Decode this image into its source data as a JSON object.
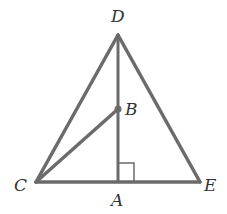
{
  "diagram": {
    "type": "geometry",
    "colors": {
      "stroke": "#6b6b6b",
      "label": "#333333",
      "background": "#ffffff"
    },
    "points": {
      "D": {
        "label": "D",
        "x": 118,
        "y": 35
      },
      "B": {
        "label": "B",
        "x": 118,
        "y": 109
      },
      "C": {
        "label": "C",
        "x": 36,
        "y": 182
      },
      "A": {
        "label": "A",
        "x": 118,
        "y": 182
      },
      "E": {
        "label": "E",
        "x": 200,
        "y": 182
      }
    },
    "segments": [
      "DC",
      "DE",
      "CE",
      "DA",
      "CB"
    ],
    "right_angle_at": "A",
    "labels": {
      "D": "D",
      "B": "B",
      "C": "C",
      "A": "A",
      "E": "E"
    }
  }
}
